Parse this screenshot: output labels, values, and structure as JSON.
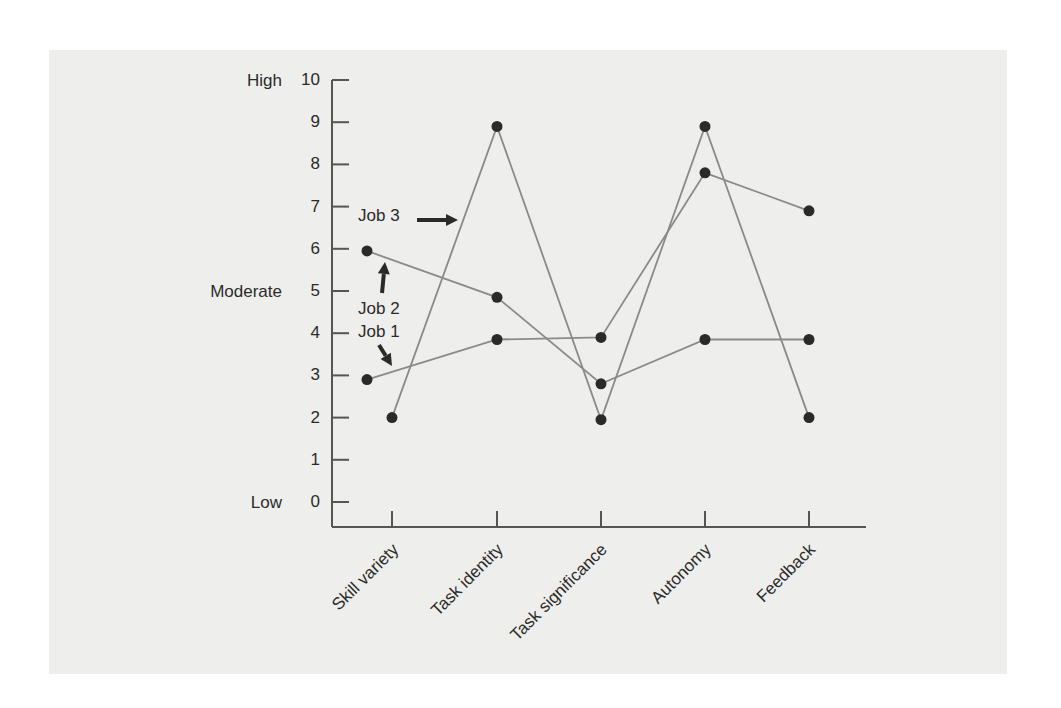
{
  "chart_data": {
    "type": "line",
    "title": "",
    "xlabel": "",
    "ylabel": "",
    "ylim": [
      0,
      10
    ],
    "yticks": [
      0,
      1,
      2,
      3,
      4,
      5,
      6,
      7,
      8,
      9,
      10
    ],
    "y_level_labels": [
      {
        "label": "High",
        "value": 10
      },
      {
        "label": "Moderate",
        "value": 5
      },
      {
        "label": "Low",
        "value": 0
      }
    ],
    "categories": [
      "Skill variety",
      "Task identity",
      "Task significance",
      "Autonomy",
      "Feedback"
    ],
    "series": [
      {
        "name": "Job 1",
        "values": [
          2.9,
          3.85,
          3.9,
          7.8,
          6.9
        ]
      },
      {
        "name": "Job 2",
        "values": [
          5.95,
          4.85,
          2.8,
          3.85,
          3.85
        ]
      },
      {
        "name": "Job 3",
        "values": [
          2.0,
          8.9,
          1.95,
          8.9,
          2.0
        ]
      }
    ],
    "annotations": [
      {
        "text": "Job 3",
        "arrow": "right"
      },
      {
        "text": "Job 2",
        "arrow": "up"
      },
      {
        "text": "Job 1",
        "arrow": "down-right"
      }
    ],
    "grid": false,
    "legend": "inline annotations with arrows"
  },
  "colors": {
    "background": "#ffffff",
    "panel": "#eeeeec",
    "axis": "#555555",
    "line": "#8a8a8a",
    "marker": "#2a2a2a",
    "text": "#2b2b2b"
  }
}
